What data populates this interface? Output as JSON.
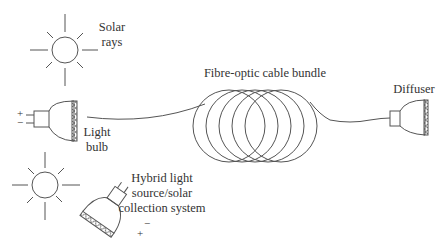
{
  "diagram": {
    "type": "schematic",
    "labels": {
      "solar_rays": [
        "Solar",
        "rays"
      ],
      "light_bulb": [
        "Light",
        "bulb"
      ],
      "cable_bundle": "Fibre-optic cable bundle",
      "diffuser": "Diffuser",
      "hybrid": [
        "Hybrid light",
        "source/solar",
        "collection system"
      ]
    },
    "polarity": {
      "plus": "+",
      "minus": "−"
    },
    "components": [
      {
        "id": "sun-top",
        "icon": "sun-icon"
      },
      {
        "id": "light-bulb",
        "icon": "light-bulb-icon"
      },
      {
        "id": "fibre-optic-coil",
        "icon": "cable-coil-icon"
      },
      {
        "id": "diffuser",
        "icon": "diffuser-icon"
      },
      {
        "id": "sun-bottom",
        "icon": "sun-icon"
      },
      {
        "id": "hybrid-collector",
        "icon": "hybrid-bulb-icon"
      }
    ],
    "colors": {
      "line": "#555555",
      "text": "#333333",
      "background": "#ffffff"
    }
  }
}
